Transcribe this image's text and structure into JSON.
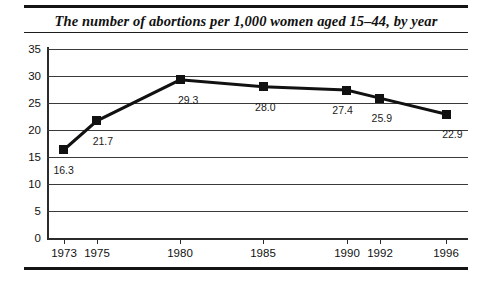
{
  "chart_data": {
    "type": "line",
    "title": "The number of abortions per 1,000 women aged 15–44, by year",
    "xlabel": "",
    "ylabel": "",
    "categories": [
      "1973",
      "1975",
      "1980",
      "1985",
      "1990",
      "1992",
      "1996"
    ],
    "x": [
      1973,
      1975,
      1980,
      1985,
      1990,
      1992,
      1996
    ],
    "values": [
      16.3,
      21.7,
      29.3,
      28.0,
      27.4,
      25.9,
      22.9
    ],
    "point_labels": [
      "16.3",
      "21.7",
      "29.3",
      "28.0",
      "27.4",
      "25.9",
      "22.9"
    ],
    "ylim": [
      0,
      35
    ],
    "yticks": [
      35,
      30,
      25,
      20,
      15,
      10,
      5,
      0
    ],
    "ytick_labels": [
      "35",
      "30",
      "25",
      "20",
      "15",
      "10",
      "5",
      "0"
    ],
    "xtick_labels": [
      "1973",
      "1975",
      "1980",
      "1985",
      "1990",
      "1992",
      "1996"
    ],
    "grid": "horizontal",
    "legend": "none",
    "marker": "square",
    "series_color": "#111111",
    "grid_color": "#3a3a3a",
    "axis_color": "#2b2b2b",
    "background_color": "#ffffff"
  },
  "figure": {
    "title": "The number of abortions per 1,000 women aged 15–44, by year"
  }
}
